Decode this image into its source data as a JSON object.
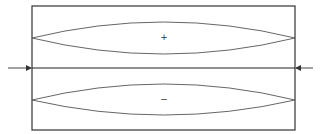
{
  "diagram": {
    "colors": {
      "frame": "#333333",
      "lens": "#555555",
      "arrow": "#333333",
      "background": "#ffffff"
    },
    "upper_region": {
      "sign": "+"
    },
    "lower_region": {
      "sign": "−"
    },
    "arrows": [
      {
        "side": "left",
        "direction": "right"
      },
      {
        "side": "right",
        "direction": "left"
      }
    ]
  }
}
